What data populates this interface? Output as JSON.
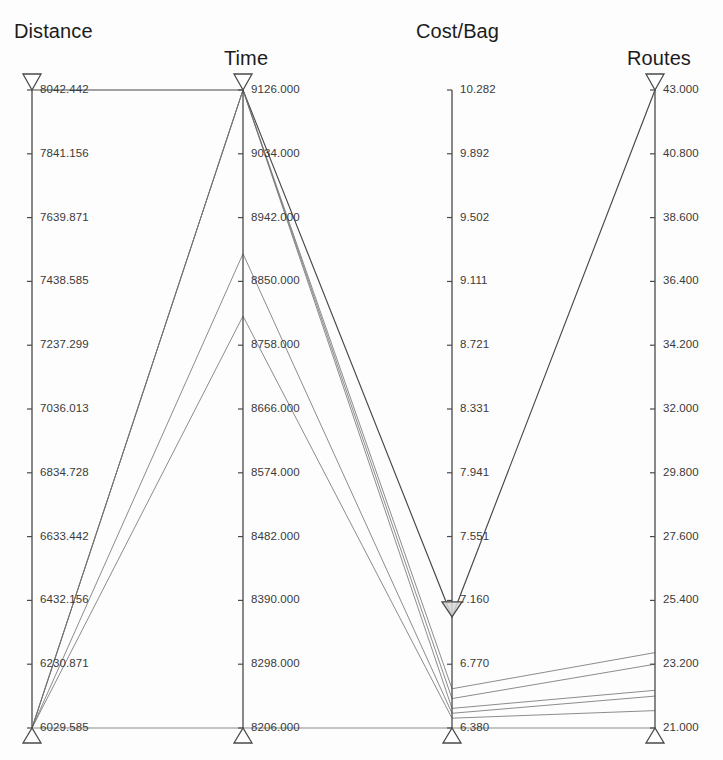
{
  "figure": {
    "type": "parallel-coordinates",
    "background": "#fdfdfd",
    "line_color": "#6f6f6f",
    "highlight_line_color": "#3d3d3d",
    "axis_color": "#4a4a4a",
    "text_color": "#3a3a3a",
    "title_color": "#1c1c1c"
  },
  "axis_titles": {
    "distance": "Distance",
    "time": "Time",
    "cost": "Cost/Bag",
    "routes": "Routes"
  },
  "chart_data": {
    "type": "line",
    "subtype": "parallel-coordinates",
    "title": "",
    "xlabel": "",
    "ylabel": "",
    "grid": false,
    "legend": "none",
    "axes": [
      {
        "name": "Distance",
        "x": 32,
        "min": 6029.585,
        "max": 8042.442,
        "top_handle": "triangle-down",
        "bottom_handle": "triangle-up",
        "ticks": [
          "8042.442",
          "7841.156",
          "7639.871",
          "7438.585",
          "7237.299",
          "7036.013",
          "6834.728",
          "6633.442",
          "6432.156",
          "6230.871",
          "6029.585"
        ],
        "tick_values": [
          8042.442,
          7841.156,
          7639.871,
          7438.585,
          7237.299,
          7036.013,
          6834.728,
          6633.442,
          6432.156,
          6230.871,
          6029.585
        ]
      },
      {
        "name": "Time",
        "x": 243,
        "min": 8206.0,
        "max": 9126.0,
        "top_handle": "triangle-down",
        "bottom_handle": "triangle-up",
        "ticks": [
          "9126.000",
          "9034.000",
          "8942.000",
          "8850.000",
          "8758.000",
          "8666.000",
          "8574.000",
          "8482.000",
          "8390.000",
          "8298.000",
          "8206.000"
        ],
        "tick_values": [
          9126.0,
          9034.0,
          8942.0,
          8850.0,
          8758.0,
          8666.0,
          8574.0,
          8482.0,
          8390.0,
          8298.0,
          8206.0
        ]
      },
      {
        "name": "Cost/Bag",
        "x": 452,
        "min": 6.38,
        "max": 10.282,
        "top_handle": "none",
        "bottom_handle": "triangle-up",
        "slider_handle": {
          "value": 7.06,
          "style": "triangle-down-filled"
        },
        "ticks": [
          "10.282",
          "9.892",
          "9.502",
          "9.111",
          "8.721",
          "8.331",
          "7.941",
          "7.551",
          "7.160",
          "6.770",
          "6.380"
        ],
        "tick_values": [
          10.282,
          9.892,
          9.502,
          9.111,
          8.721,
          8.331,
          7.941,
          7.551,
          7.16,
          6.77,
          6.38
        ]
      },
      {
        "name": "Routes",
        "x": 655,
        "min": 21.0,
        "max": 43.0,
        "top_handle": "triangle-down",
        "bottom_handle": "triangle-up",
        "ticks": [
          "43.000",
          "40.800",
          "38.600",
          "36.400",
          "34.200",
          "32.000",
          "29.800",
          "27.600",
          "25.400",
          "23.200",
          "21.000"
        ],
        "tick_values": [
          43.0,
          40.8,
          38.6,
          36.4,
          34.2,
          32.0,
          29.8,
          27.6,
          25.4,
          23.2,
          21.0
        ]
      }
    ],
    "dimensions": [
      "Distance",
      "Time",
      "Cost/Bag",
      "Routes"
    ],
    "series": [
      {
        "name": "route-1",
        "values": [
          8042.442,
          9126.0,
          7.06,
          43.0
        ],
        "highlight": true
      },
      {
        "name": "route-2",
        "values": [
          6029.585,
          9126.0,
          6.62,
          23.6
        ],
        "highlight": false
      },
      {
        "name": "route-3",
        "values": [
          6029.585,
          9126.0,
          6.56,
          23.2
        ],
        "highlight": false
      },
      {
        "name": "route-4",
        "values": [
          6029.585,
          9126.0,
          6.5,
          22.3
        ],
        "highlight": false
      },
      {
        "name": "route-5",
        "values": [
          6029.585,
          8890.0,
          6.47,
          22.1
        ],
        "highlight": false
      },
      {
        "name": "route-6",
        "values": [
          6029.585,
          8800.0,
          6.44,
          21.6
        ],
        "highlight": false
      },
      {
        "name": "route-7",
        "values": [
          6029.585,
          8206.0,
          6.38,
          21.0
        ],
        "highlight": false
      }
    ]
  }
}
